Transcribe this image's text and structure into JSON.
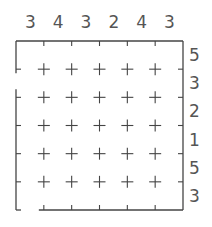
{
  "puzzle": {
    "type": "skyscrapers",
    "size": 6,
    "top_clues": [
      "3",
      "4",
      "3",
      "2",
      "4",
      "3"
    ],
    "right_clues": [
      "5",
      "3",
      "2",
      "1",
      "5",
      "3"
    ],
    "cells": [
      [
        "",
        "",
        "",
        "",
        "",
        ""
      ],
      [
        "",
        "",
        "",
        "",
        "",
        ""
      ],
      [
        "",
        "",
        "",
        "",
        "",
        ""
      ],
      [
        "",
        "",
        "",
        "",
        "",
        ""
      ],
      [
        "",
        "",
        "",
        "",
        "",
        ""
      ],
      [
        "",
        "",
        "",
        "",
        "",
        ""
      ]
    ],
    "border_gaps": [
      {
        "side": "left",
        "between_rows": [
          1,
          2
        ]
      },
      {
        "side": "bottom",
        "column": 1
      }
    ]
  },
  "colors": {
    "line": "#444444",
    "clue": "#555555",
    "background": "#ffffff"
  }
}
